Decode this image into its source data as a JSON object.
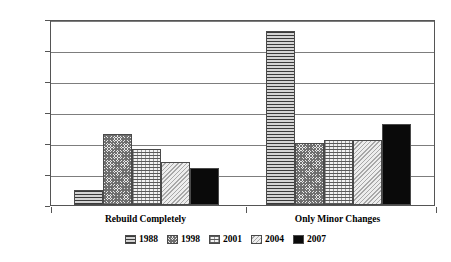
{
  "chart_data": {
    "type": "bar",
    "title": "",
    "xlabel": "",
    "ylabel": "Public Opinion (Percent)",
    "categories": [
      "Rebuild Completely",
      "Only Minor Changes"
    ],
    "ylim": [
      0,
      60
    ],
    "yticks": [
      "0",
      "10",
      "20",
      "30",
      "40",
      "50",
      "60"
    ],
    "grid": true,
    "legend_position": "bottom",
    "series": [
      {
        "name": "1988",
        "values": [
          5,
          56
        ]
      },
      {
        "name": "1998",
        "values": [
          23,
          20
        ]
      },
      {
        "name": "2001",
        "values": [
          18,
          21
        ]
      },
      {
        "name": "2004",
        "values": [
          14,
          21
        ]
      },
      {
        "name": "2007",
        "values": [
          12,
          26
        ]
      }
    ]
  }
}
